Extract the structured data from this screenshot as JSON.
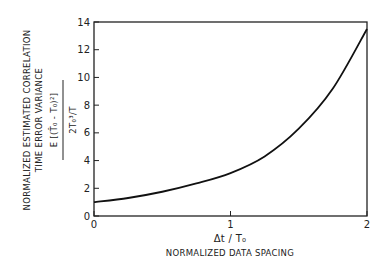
{
  "chart_data": {
    "type": "line",
    "title": "",
    "xlabel_symbol": "Δt / T₀",
    "xlabel": "NORMALIZED DATA SPACING",
    "ylabel_line1": "NORMALIZED ESTIMATED CORRELATION",
    "ylabel_line2": "TIME ERROR VARIANCE",
    "ylabel_formula_numerator": "E [(T̂₀ - T₀)²]",
    "ylabel_formula_denominator": "2T₀³/T",
    "xlim": [
      0,
      2
    ],
    "ylim": [
      0,
      14
    ],
    "x_ticks": [
      "0",
      "1",
      "2"
    ],
    "y_ticks": [
      "0",
      "2",
      "4",
      "6",
      "8",
      "10",
      "12",
      "14"
    ],
    "grid": false,
    "legend": null,
    "series": [
      {
        "name": "variance",
        "x": [
          0,
          0.25,
          0.5,
          0.75,
          1.0,
          1.25,
          1.5,
          1.75,
          2.0
        ],
        "y": [
          1.0,
          1.3,
          1.75,
          2.35,
          3.1,
          4.3,
          6.3,
          9.2,
          13.5
        ]
      }
    ]
  }
}
